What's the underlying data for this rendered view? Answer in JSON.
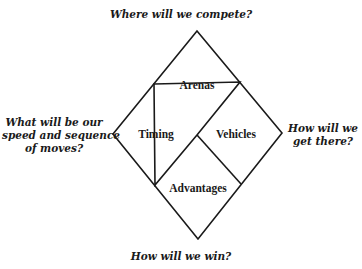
{
  "diagram": {
    "type": "strategy-diamond",
    "questions": {
      "top": "Where will we compete?",
      "left_lines": [
        "What will be our",
        "speed and sequence",
        "of moves?"
      ],
      "right_lines": [
        "How will we",
        "get there?"
      ],
      "bottom": "How will we win?"
    },
    "elements": {
      "top": "Arenas",
      "left": "Timing",
      "right": "Vehicles",
      "bottom": "Advantages"
    },
    "stroke_color": "#1a1a1a",
    "background_color": "#ffffff"
  }
}
